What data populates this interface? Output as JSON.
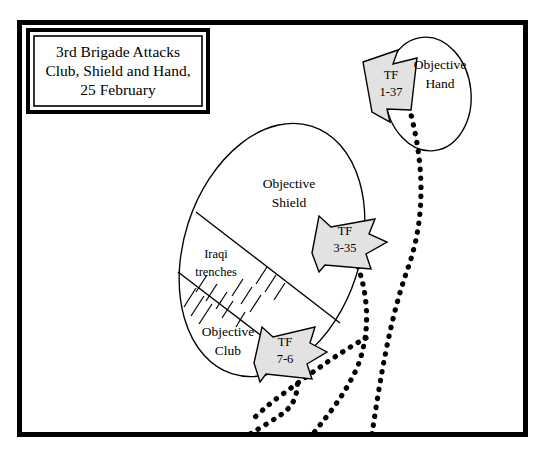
{
  "figure": {
    "kind": "military-tactical-map",
    "background_color": "#ffffff",
    "frame": {
      "name": "map-border",
      "color": "#000000",
      "x": 17,
      "y": 20,
      "width": 511,
      "height": 417,
      "stroke_width": 5
    }
  },
  "title_box": {
    "border_color": "#000000",
    "fill_color": "#ffffff",
    "x": 28,
    "y": 30,
    "width": 180,
    "height": 82,
    "lines": [
      "3rd Brigade Attacks",
      "Club, Shield and Hand,",
      "25 February"
    ]
  },
  "objectives": [
    {
      "name": "objective-shield",
      "label_lines": [
        "Objective",
        "Shield"
      ],
      "label_x": 289,
      "label_y": 192,
      "shape": "ellipse"
    },
    {
      "name": "objective-club",
      "label_lines": [
        "Objective",
        "Club"
      ],
      "label_x": 228,
      "label_y": 340,
      "shape": "ellipse-lower-sector"
    },
    {
      "name": "objective-hand",
      "label_lines": [
        "Objective",
        "Hand"
      ],
      "label_x": 437,
      "label_y": 73,
      "shape": "ellipse"
    }
  ],
  "terrain": {
    "trenches": {
      "name": "iraqi-trenches",
      "label_lines": [
        "Iraqi",
        "trenches"
      ],
      "label_x": 216,
      "label_y": 262,
      "hatch_count": 14
    }
  },
  "units": [
    {
      "name": "tf-1-37",
      "designation": "TF",
      "number": "1-37",
      "fill_color": "#e2e2e2",
      "outline_color": "#000000",
      "label_x": 391,
      "label_y": 83,
      "heading": "west",
      "objective": "Objective Hand"
    },
    {
      "name": "tf-3-35",
      "designation": "TF",
      "number": "3-35",
      "fill_color": "#e2e2e2",
      "outline_color": "#000000",
      "label_x": 344,
      "label_y": 239,
      "heading": "northwest",
      "objective": "Objective Shield"
    },
    {
      "name": "tf-7-6",
      "designation": "TF",
      "number": "7-6",
      "fill_color": "#e2e2e2",
      "outline_color": "#000000",
      "label_x": 283,
      "label_y": 349,
      "heading": "northwest",
      "objective": "Objective Club"
    }
  ],
  "routes": [
    {
      "name": "axis-of-advance-right",
      "style": "dotted",
      "color": "#000000"
    },
    {
      "name": "axis-of-advance-center",
      "style": "dotted",
      "color": "#000000"
    },
    {
      "name": "axis-of-advance-left",
      "style": "dotted",
      "color": "#000000"
    }
  ]
}
